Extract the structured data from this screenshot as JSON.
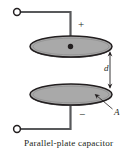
{
  "figure": {
    "caption": "Parallel-plate capacitor",
    "labels": {
      "positive_terminal_sign": "+",
      "negative_terminal_sign": "−",
      "separation": "d",
      "area": "A"
    },
    "colors": {
      "plate_fill": "#a9a9a9",
      "plate_stroke": "#231f20",
      "wire": "#58595b",
      "ink": "#231f20",
      "background": "#ffffff",
      "terminal_fill": "#ffffff"
    },
    "geometry": {
      "top_plate": {
        "cx": 71,
        "cy": 46.5,
        "rx": 41,
        "ry": 10.5
      },
      "bottom_plate": {
        "cx": 71,
        "cy": 94.5,
        "rx": 41,
        "ry": 10.5
      },
      "center_dot": {
        "cx": 71,
        "cy": 46.5,
        "r": 2.6
      },
      "separation_arrow": {
        "x": 110,
        "y_top": 52,
        "y_bottom": 88
      },
      "top_terminal": {
        "cx": 17,
        "cy": 12,
        "r": 3.3
      },
      "bottom_terminal": {
        "cx": 17,
        "cy": 129,
        "r": 3.3
      }
    }
  }
}
